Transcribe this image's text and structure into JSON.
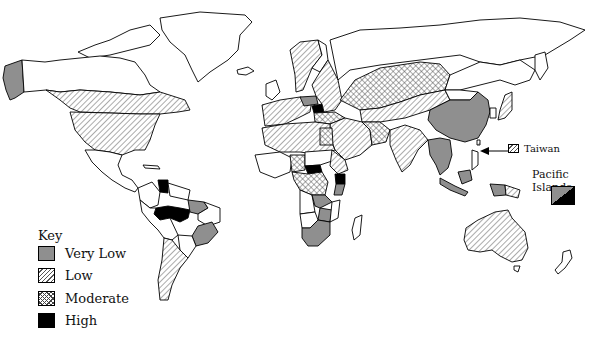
{
  "map": {
    "type": "choropleth world map",
    "legend": {
      "title": "Key",
      "items": [
        {
          "label": "Very Low",
          "pattern": "solid-gray",
          "color": "#8f8f8f"
        },
        {
          "label": "Low",
          "pattern": "diagonal-hatch"
        },
        {
          "label": "Moderate",
          "pattern": "cross-hatch"
        },
        {
          "label": "High",
          "pattern": "solid-black",
          "color": "#000000"
        }
      ]
    },
    "annotations": {
      "taiwan": "Taiwan",
      "pacific_islands": "Pacific Islands"
    },
    "regions": {
      "very_low": [
        "Alaska (USA)",
        "Northeast Brazil",
        "Southeast Brazil",
        "Poland",
        "China",
        "Southeast Asia mainland",
        "Indonesia",
        "Papua New Guinea (west)",
        "Zambia",
        "Zimbabwe",
        "South Africa",
        "Tanzania (part)"
      ],
      "low": [
        "Canada (south)",
        "United States",
        "Argentina",
        "Chile",
        "Western Europe",
        "Scandinavia",
        "Western Russia",
        "North Africa",
        "Middle East",
        "India",
        "Central Asia",
        "Australia",
        "Japan",
        "Taiwan",
        "Papua New Guinea (east)"
      ],
      "moderate": [
        "Russia (central/Siberia)",
        "Kazakhstan",
        "West Africa",
        "Central Africa",
        "Egypt",
        "Turkey",
        "Iran"
      ],
      "high": [
        "Venezuela",
        "Amazon Brazil",
        "Ukraine/Belarus",
        "Central African Republic",
        "Kenya"
      ]
    }
  }
}
